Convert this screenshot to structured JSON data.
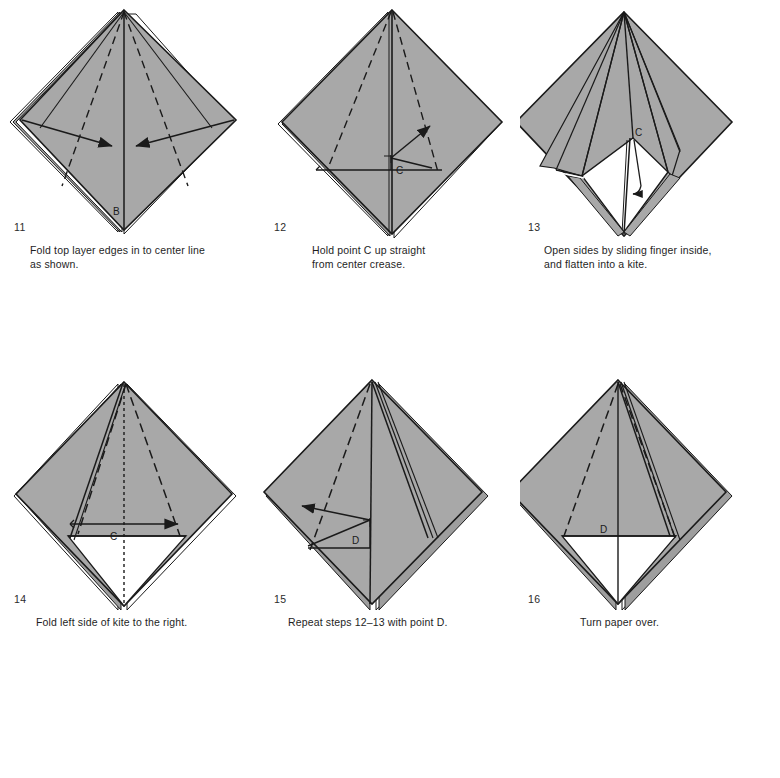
{
  "document": {
    "type": "origami-instruction-diagram",
    "page_background": "#ffffff",
    "paper_fill": "#a8a8a8",
    "paper_back_fill": "#ffffff",
    "line_color": "#1a1a1a",
    "text_color": "#1e1e1e"
  },
  "steps": [
    {
      "number": "11",
      "caption": "Fold top layer edges in to center line as shown.",
      "caption_lines": [
        "Fold top layer edges in to center line",
        "as shown."
      ],
      "point_labels": [
        "B"
      ],
      "arrows": 2,
      "arrow_description": "two arrows from left and right corners pointing in to the center line",
      "crease_style": "dashed valley folds"
    },
    {
      "number": "12",
      "caption": "Hold point C up straight from center crease.",
      "caption_lines": [
        "Hold point C up straight",
        "from center crease."
      ],
      "point_labels": [
        "C"
      ],
      "arrows": 1,
      "arrow_description": "arrow from point C pointing up and to the right",
      "crease_style": "dashed valley folds"
    },
    {
      "number": "13",
      "caption": "Open sides by sliding finger inside, and flatten into a kite.",
      "caption_lines": [
        "Open sides by sliding finger inside,",
        "and flatten into a kite."
      ],
      "point_labels": [
        "C"
      ],
      "arrows": 1,
      "arrow_description": "curved arrow from C pointing down inside the opened pocket",
      "crease_style": "solid edges, opened pocket shown white"
    },
    {
      "number": "14",
      "caption": "Fold left side of kite to the right.",
      "caption_lines": [
        "Fold left side of kite to the right."
      ],
      "point_labels": [
        "C"
      ],
      "arrows": 1,
      "arrow_description": "arrow pointing from left edge to the right",
      "crease_style": "dashed valley fold with dotted center line"
    },
    {
      "number": "15",
      "caption": "Repeat steps 12–13 with point D.",
      "caption_lines": [
        "Repeat steps 12–13 with point D."
      ],
      "point_labels": [
        "D"
      ],
      "arrows": 1,
      "arrow_description": "arrow from point D pointing up and to the left",
      "crease_style": "dashed valley fold"
    },
    {
      "number": "16",
      "caption": "Turn paper over.",
      "caption_lines": [
        "Turn paper over."
      ],
      "point_labels": [
        "D"
      ],
      "arrows": 0,
      "arrow_description": "no arrows",
      "crease_style": "dashed fold line on right side"
    }
  ]
}
